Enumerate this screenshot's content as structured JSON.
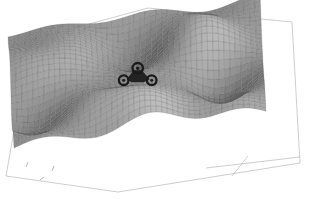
{
  "figure": {
    "title": "",
    "background_color": "#ffffff",
    "render_style": "grayscale wireframe surface mesh, scanned halftone",
    "object_label": "rover"
  },
  "chart_data": {
    "type": "surface",
    "title": "",
    "subtitle": "",
    "xlabel": "",
    "ylabel": "",
    "zlabel": "",
    "grid": true,
    "legend": null,
    "legend_position": "none",
    "colormap": "grayscale",
    "colors": {
      "mesh_light": "#e6e6e6",
      "mesh_mid": "#9b9b9b",
      "mesh_dark": "#3a3a3a",
      "mesh_line": "#4a4a4a",
      "axis": "#b9b9b9",
      "object": "#1a1a1a",
      "background": "#ffffff"
    },
    "projection": {
      "kind": "3d-perspective",
      "azimuth_deg": -35,
      "elevation_deg": 28
    },
    "axis_ranges": {
      "x": [
        0,
        40
      ],
      "y": [
        0,
        40
      ],
      "z": [
        -1,
        1
      ]
    },
    "tick_labels": {
      "x": [
        "",
        "",
        ""
      ],
      "y": [
        "",
        "",
        ""
      ],
      "z": [
        "",
        "",
        ""
      ]
    },
    "grid_resolution": {
      "nx": 46,
      "ny": 34
    },
    "annotations": [
      {
        "name": "rover",
        "text": "",
        "x_frac": 0.5,
        "y_frac": 0.38,
        "description": "small three-wheeled rover vehicle resting on the terrain surface"
      }
    ],
    "surface_features": [
      {
        "name": "ridge-top-center",
        "x_frac": 0.55,
        "y_frac": 0.12,
        "height": 0.85,
        "kind": "peak"
      },
      {
        "name": "ridge-upper-left",
        "x_frac": 0.22,
        "y_frac": 0.22,
        "height": 0.6,
        "kind": "peak"
      },
      {
        "name": "basin-left",
        "x_frac": 0.14,
        "y_frac": 0.33,
        "height": -0.75,
        "kind": "valley"
      },
      {
        "name": "basin-right",
        "x_frac": 0.85,
        "y_frac": 0.42,
        "height": -0.8,
        "kind": "valley"
      },
      {
        "name": "basin-front-center",
        "x_frac": 0.48,
        "y_frac": 0.76,
        "height": -0.7,
        "kind": "valley"
      },
      {
        "name": "mound-front-left",
        "x_frac": 0.25,
        "y_frac": 0.66,
        "height": 0.55,
        "kind": "peak"
      },
      {
        "name": "mound-front-right",
        "x_frac": 0.72,
        "y_frac": 0.7,
        "height": 0.5,
        "kind": "peak"
      },
      {
        "name": "shoulder-right",
        "x_frac": 0.9,
        "y_frac": 0.18,
        "height": 0.45,
        "kind": "peak"
      }
    ],
    "values_note": "Elevation field z(x,y) rendered as a wireframe mesh; z values are normalized to [-1, 1] and sampled on a 46 x 34 grid."
  }
}
